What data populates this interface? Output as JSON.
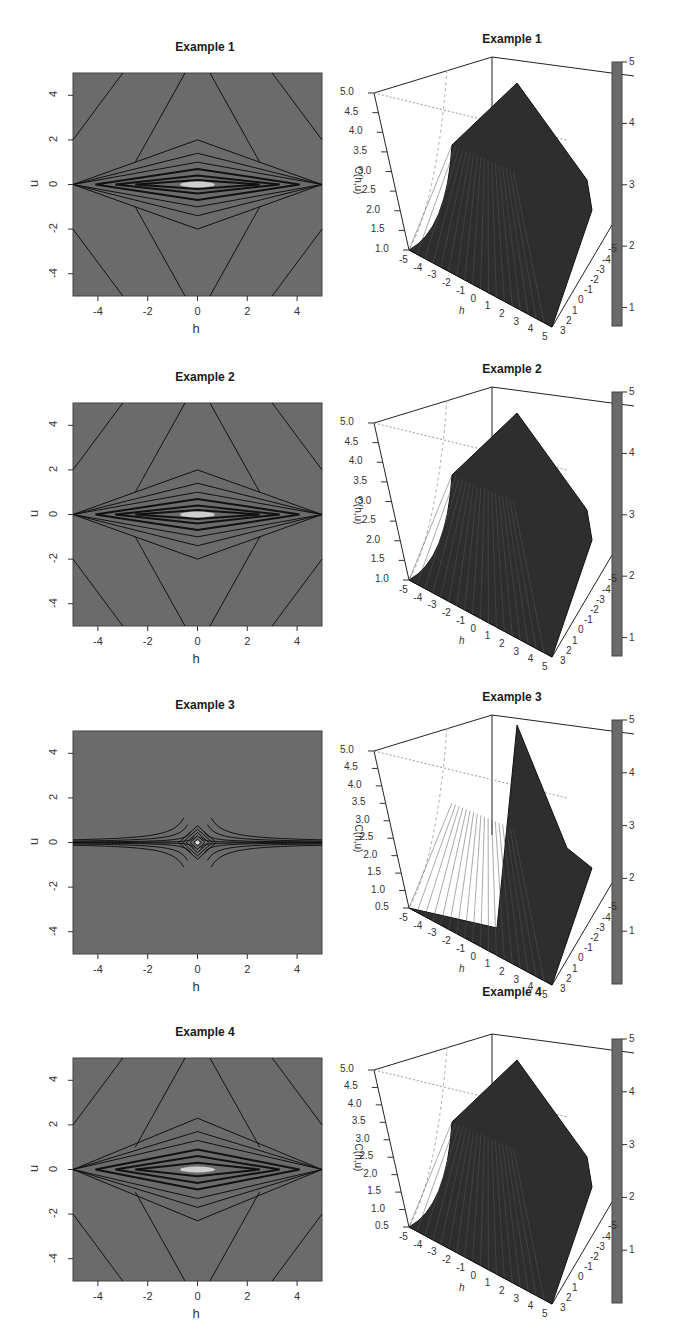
{
  "figure": {
    "background": "#ffffff",
    "contour_fill": "#6b6b6b",
    "surface_fill": "#2e2e2e",
    "colorbar_color": "#6a6a6a"
  },
  "chart_data": [
    {
      "type": "heatmap",
      "subtype": "contour",
      "title": "Example 1",
      "xlabel": "h",
      "ylabel": "u",
      "xlim": [
        -5,
        5
      ],
      "ylim": [
        -5,
        5
      ],
      "xticks": [
        "-4",
        "-2",
        "0",
        "2",
        "4"
      ],
      "yticks": [
        "-4",
        "-2",
        "0",
        "2",
        "4"
      ],
      "description": "Contours of C(h,u); elongated diamond levels around u=0, peak at origin, hyperbolic outer contours"
    },
    {
      "type": "surface",
      "title": "Example 1",
      "xlabel": "h",
      "ylabel": "u",
      "zlabel": "C(h,u)",
      "xticks": [
        "-5",
        "-4",
        "-3",
        "-2",
        "-1",
        "0",
        "1",
        "2",
        "3",
        "4",
        "5"
      ],
      "yticks": [
        "-5",
        "-4",
        "-3",
        "-2",
        "-1",
        "0",
        "1",
        "2",
        "3"
      ],
      "zticks": [
        "1.0",
        "1.5",
        "2.0",
        "2.5",
        "3.0",
        "3.5",
        "4.0",
        "4.5",
        "5.0"
      ],
      "zlim": [
        1.0,
        5.0
      ],
      "colorbar": {
        "ticks": [
          "1",
          "2",
          "3",
          "4",
          "5"
        ],
        "range": [
          0.7,
          5
        ]
      }
    },
    {
      "type": "heatmap",
      "subtype": "contour",
      "title": "Example 2",
      "xlabel": "h",
      "ylabel": "u",
      "xlim": [
        -5,
        5
      ],
      "ylim": [
        -5,
        5
      ],
      "xticks": [
        "-4",
        "-2",
        "0",
        "2",
        "4"
      ],
      "yticks": [
        "-4",
        "-2",
        "0",
        "2",
        "4"
      ],
      "description": "Contours similar to Example 1, diamond-shaped near u=0"
    },
    {
      "type": "surface",
      "title": "Example 2",
      "xlabel": "h",
      "ylabel": "u",
      "zlabel": "C(h,u)",
      "xticks": [
        "-5",
        "-4",
        "-3",
        "-2",
        "-1",
        "0",
        "1",
        "2",
        "3",
        "4",
        "5"
      ],
      "yticks": [
        "-5",
        "-4",
        "-3",
        "-2",
        "-1",
        "0",
        "1",
        "2",
        "3"
      ],
      "zticks": [
        "1.0",
        "1.5",
        "2.0",
        "2.5",
        "3.0",
        "3.5",
        "4.0",
        "4.5",
        "5.0"
      ],
      "zlim": [
        1.0,
        5.0
      ],
      "colorbar": {
        "ticks": [
          "1",
          "2",
          "3",
          "4",
          "5"
        ],
        "range": [
          0.7,
          5
        ]
      }
    },
    {
      "type": "heatmap",
      "subtype": "contour",
      "title": "Example 3",
      "xlabel": "h",
      "ylabel": "u",
      "xlim": [
        -5,
        5
      ],
      "ylim": [
        -5,
        5
      ],
      "xticks": [
        "-4",
        "-2",
        "0",
        "2",
        "4"
      ],
      "yticks": [
        "-4",
        "-2",
        "0",
        "2",
        "4"
      ],
      "description": "Star/cross shaped contours, sharp peak at origin, lines asymptotic to both axes"
    },
    {
      "type": "surface",
      "title": "Example 3",
      "xlabel": "h",
      "ylabel": "u",
      "zlabel": "C(h,u)",
      "xticks": [
        "-5",
        "-4",
        "-3",
        "-2",
        "-1",
        "0",
        "1",
        "2",
        "3",
        "4",
        "5"
      ],
      "yticks": [
        "-5",
        "-4",
        "-3",
        "-2",
        "-1",
        "0",
        "1",
        "2",
        "3"
      ],
      "zticks": [
        "0.5",
        "1.0",
        "1.5",
        "2.0",
        "2.5",
        "3.0",
        "3.5",
        "4.0",
        "4.5",
        "5.0"
      ],
      "zlim": [
        0.5,
        5.0
      ],
      "colorbar": {
        "ticks": [
          "1",
          "2",
          "3",
          "4",
          "5"
        ],
        "range": [
          0.0,
          5
        ]
      }
    },
    {
      "type": "heatmap",
      "subtype": "contour",
      "title": "Example 4",
      "xlabel": "h",
      "ylabel": "u",
      "xlim": [
        -5,
        5
      ],
      "ylim": [
        -5,
        5
      ],
      "xticks": [
        "-4",
        "-2",
        "0",
        "2",
        "4"
      ],
      "yticks": [
        "-4",
        "-2",
        "0",
        "2",
        "4"
      ],
      "description": "Wider diamond contours around u=0, outer hyperbolic contours"
    },
    {
      "type": "surface",
      "title": "Example 4",
      "xlabel": "h",
      "ylabel": "u",
      "zlabel": "C(h,u)",
      "xticks": [
        "-5",
        "-4",
        "-3",
        "-2",
        "-1",
        "0",
        "1",
        "2",
        "3",
        "4",
        "5"
      ],
      "yticks": [
        "-5",
        "-4",
        "-3",
        "-2",
        "-1",
        "0",
        "1",
        "2",
        "3"
      ],
      "zticks": [
        "0.5",
        "1.0",
        "1.5",
        "2.0",
        "2.5",
        "3.0",
        "3.5",
        "4.0",
        "4.5",
        "5.0"
      ],
      "zlim": [
        0.5,
        5.0
      ],
      "colorbar": {
        "ticks": [
          "1",
          "2",
          "3",
          "4",
          "5"
        ],
        "range": [
          0.0,
          5
        ]
      }
    }
  ]
}
